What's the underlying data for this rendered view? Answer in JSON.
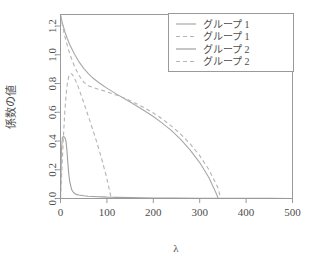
{
  "chart_data": {
    "type": "line",
    "title": "",
    "xlabel": "λ",
    "ylabel": "係数の値",
    "xlim": [
      0,
      500
    ],
    "ylim": [
      0,
      1.28
    ],
    "xticks": [
      0,
      100,
      200,
      300,
      400,
      500
    ],
    "xtick_labels": [
      "0",
      "100",
      "200",
      "300",
      "400",
      "500"
    ],
    "yticks": [
      0.0,
      0.2,
      0.4,
      0.6,
      0.8,
      1.0,
      1.2
    ],
    "ytick_labels": [
      "0.0",
      "0.2",
      "0.4",
      "0.6",
      "0.8",
      "1.0",
      "1.2"
    ],
    "grid": false,
    "legend_position": "top-right",
    "series": [
      {
        "name": "グループ 1",
        "style": "solid",
        "color": "#a8a8a8",
        "x": [
          0,
          5,
          10,
          15,
          20,
          30,
          40,
          50,
          60,
          70,
          80,
          90,
          100,
          120,
          140,
          160,
          180,
          200,
          220,
          240,
          260,
          280,
          300,
          320,
          335,
          340,
          360,
          400,
          450,
          500
        ],
        "y": [
          1.275,
          1.21,
          1.155,
          1.11,
          1.07,
          1.005,
          0.95,
          0.905,
          0.868,
          0.838,
          0.812,
          0.79,
          0.768,
          0.728,
          0.69,
          0.652,
          0.612,
          0.57,
          0.523,
          0.47,
          0.408,
          0.335,
          0.25,
          0.145,
          0.04,
          0.0,
          0.0,
          0.0,
          0.0,
          0.0
        ]
      },
      {
        "name": "グループ 1",
        "style": "dashed",
        "color": "#b4b4b4",
        "x": [
          0,
          5,
          10,
          15,
          20,
          30,
          40,
          50,
          60,
          70,
          80,
          100,
          120,
          140,
          160,
          180,
          200,
          220,
          240,
          260,
          280,
          300,
          320,
          340,
          345,
          360,
          400,
          450,
          500
        ],
        "y": [
          1.275,
          1.19,
          1.12,
          1.06,
          1.005,
          0.92,
          0.855,
          0.81,
          0.785,
          0.772,
          0.762,
          0.742,
          0.72,
          0.695,
          0.665,
          0.632,
          0.595,
          0.552,
          0.502,
          0.445,
          0.378,
          0.298,
          0.2,
          0.07,
          0.0,
          0.0,
          0.0,
          0.0,
          0.0
        ]
      },
      {
        "name": "グループ 2",
        "style": "solid",
        "color": "#a0a0a0",
        "x": [
          0,
          2,
          4,
          6,
          8,
          10,
          12,
          14,
          16,
          18,
          20,
          24,
          28,
          32,
          36,
          40,
          50,
          60,
          70,
          80,
          90,
          100,
          110,
          120,
          150,
          200,
          250,
          300,
          350,
          400,
          450,
          500
        ],
        "y": [
          0.0,
          0.33,
          0.425,
          0.43,
          0.428,
          0.42,
          0.395,
          0.33,
          0.24,
          0.165,
          0.115,
          0.062,
          0.042,
          0.032,
          0.027,
          0.024,
          0.019,
          0.016,
          0.014,
          0.012,
          0.011,
          0.0095,
          0.009,
          0.008,
          0.006,
          0.004,
          0.003,
          0.002,
          0.0015,
          0.001,
          0.0008,
          0.0005
        ]
      },
      {
        "name": "グループ 2",
        "style": "dashed",
        "color": "#b4b4b4",
        "x": [
          0,
          3,
          6,
          9,
          12,
          15,
          18,
          21,
          24,
          27,
          30,
          34,
          38,
          42,
          46,
          50,
          55,
          60,
          65,
          70,
          75,
          80,
          85,
          90,
          95,
          100,
          105,
          108,
          110,
          150,
          200,
          300,
          400,
          500
        ],
        "y": [
          0.0,
          0.2,
          0.41,
          0.59,
          0.72,
          0.805,
          0.852,
          0.868,
          0.868,
          0.855,
          0.838,
          0.81,
          0.778,
          0.742,
          0.705,
          0.668,
          0.62,
          0.572,
          0.524,
          0.475,
          0.425,
          0.372,
          0.318,
          0.26,
          0.2,
          0.138,
          0.065,
          0.02,
          0.0,
          0.0,
          0.0,
          0.0,
          0.0,
          0.0
        ]
      }
    ],
    "legend_entries": [
      {
        "label": "グループ 1",
        "style": "solid",
        "color": "#a8a8a8"
      },
      {
        "label": "グループ 1",
        "style": "dashed",
        "color": "#b4b4b4"
      },
      {
        "label": "グループ 2",
        "style": "solid",
        "color": "#a0a0a0"
      },
      {
        "label": "グループ 2",
        "style": "dashed",
        "color": "#b4b4b4"
      }
    ]
  }
}
